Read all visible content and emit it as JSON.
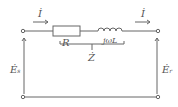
{
  "diagram": {
    "type": "circuit",
    "labels": {
      "current_left": "İ",
      "current_right": "İ",
      "resistor": "R",
      "inductor": "jωL",
      "impedance": "Ż",
      "source_sending": "Ė",
      "source_sending_sub": "s",
      "source_receiving": "Ė",
      "source_receiving_sub": "r"
    },
    "colors": {
      "line": "#666666",
      "text": "#555555"
    }
  }
}
